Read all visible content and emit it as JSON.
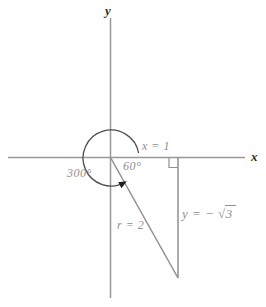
{
  "figure_title": "angle-300-degrees-reference-triangle-diagram",
  "labels": {
    "y_axis": "y",
    "x_axis": "x",
    "x_leg": "x = 1",
    "reference_angle": "60°",
    "rotation_angle": "300°",
    "hypotenuse": "r = 2",
    "y_leg_prefix": "y = −",
    "sqrt_sign": "√",
    "y_leg_radicand": "3"
  },
  "colors": {
    "background": "#ffffff",
    "axis_line": "#999999",
    "triangle_line": "#8f8f8f",
    "arc_line": "#4f4f4f",
    "arrowhead": "#1e1e1e",
    "label_gray": "#8f8f8f",
    "label_dark": "#2e2e2e"
  }
}
